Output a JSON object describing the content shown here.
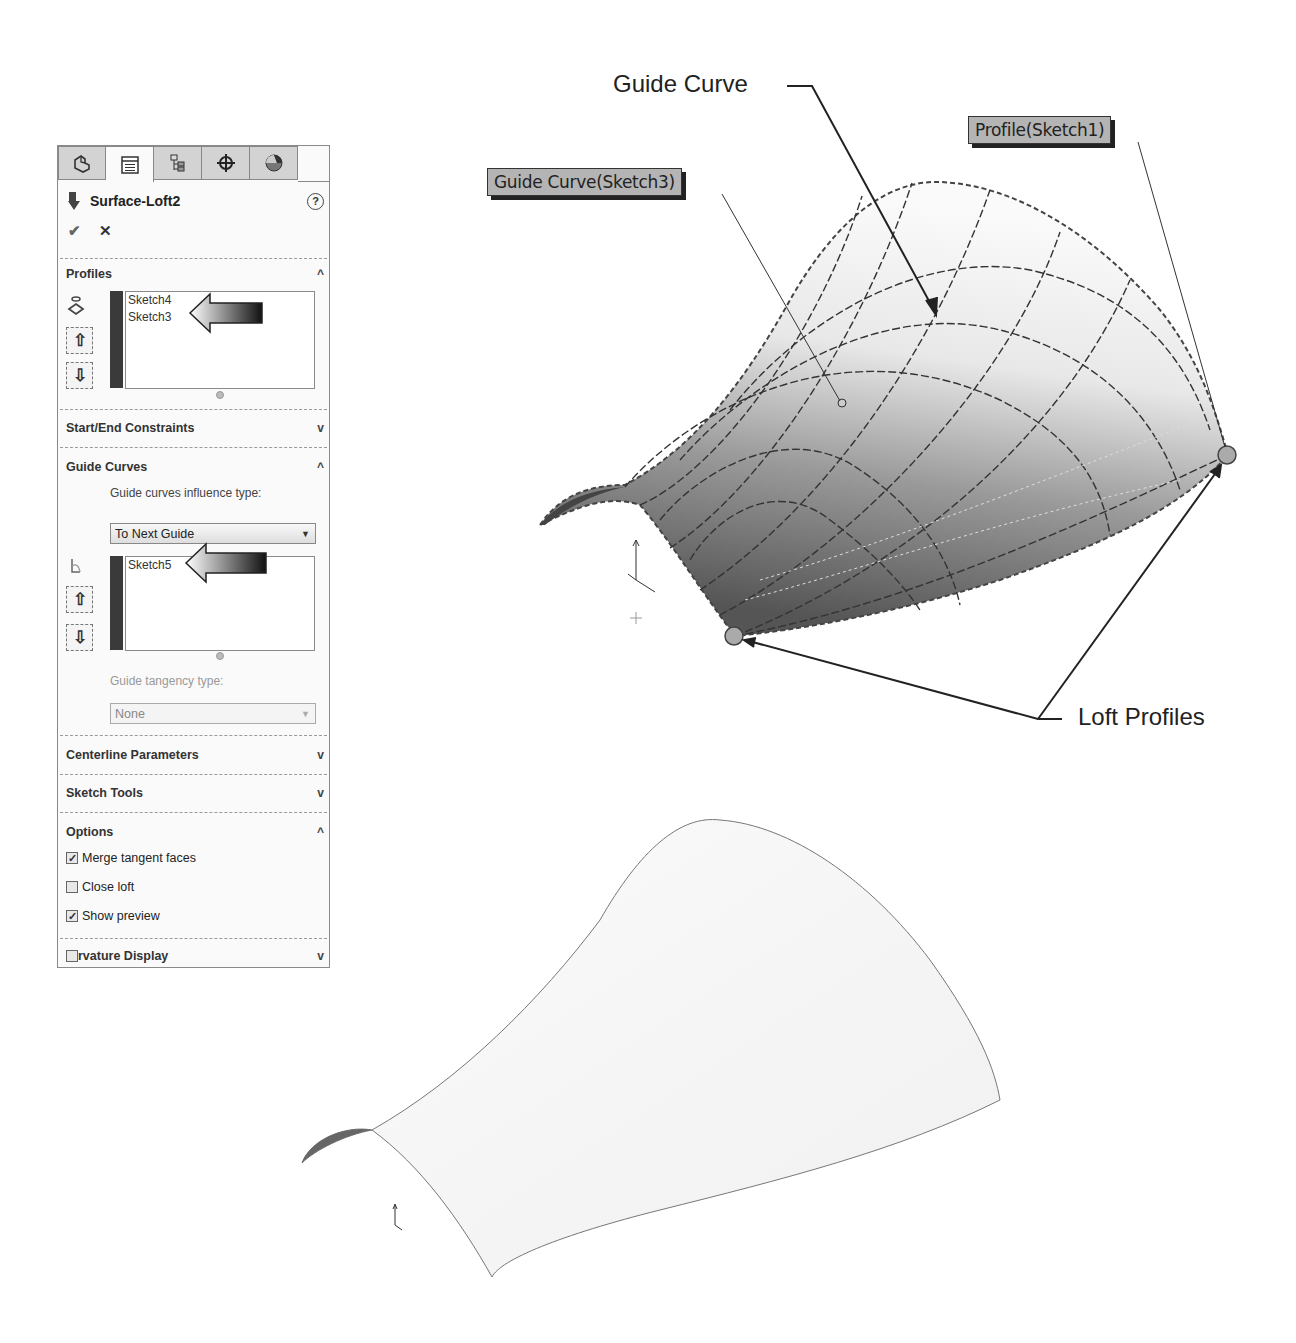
{
  "panel": {
    "tabs": [
      {
        "name": "feature-manager-tab",
        "icon": "part-icon"
      },
      {
        "name": "property-manager-tab",
        "icon": "property-list-icon",
        "active": true
      },
      {
        "name": "configuration-manager-tab",
        "icon": "configuration-icon"
      },
      {
        "name": "dimxpert-manager-tab",
        "icon": "crosshair-icon"
      },
      {
        "name": "display-manager-tab",
        "icon": "appearance-sphere-icon"
      }
    ],
    "title": "Surface-Loft2",
    "help_icon": "?",
    "ok_icon": "✔",
    "cancel_icon": "✕",
    "profiles": {
      "header": "Profiles",
      "chevron": "^",
      "items": [
        "Sketch4",
        "Sketch3"
      ]
    },
    "start_end_constraints": {
      "header": "Start/End Constraints",
      "chevron": "v"
    },
    "guide_curves": {
      "header": "Guide Curves",
      "chevron": "^",
      "influence_label": "Guide curves influence type:",
      "influence_value": "To Next Guide",
      "items": [
        "Sketch5"
      ],
      "tangency_label": "Guide tangency type:",
      "tangency_value": "None"
    },
    "centerline_parameters": {
      "header": "Centerline Parameters",
      "chevron": "v"
    },
    "sketch_tools": {
      "header": "Sketch Tools",
      "chevron": "v"
    },
    "options": {
      "header": "Options",
      "chevron": "^",
      "checkboxes": [
        {
          "label": "Merge tangent faces",
          "checked": true
        },
        {
          "label": "Close loft",
          "checked": false
        },
        {
          "label": "Show preview",
          "checked": true
        }
      ]
    },
    "curvature_display": {
      "header": "rvature Display",
      "chevron": "v",
      "checked": false
    }
  },
  "viewport": {
    "callouts": {
      "guide_curve": "Guide Curve",
      "loft_profiles": "Loft Profiles"
    },
    "tags": {
      "guide_curve_sketch3": "Guide Curve(Sketch3)",
      "profile_sketch1": "Profile(Sketch1)"
    }
  }
}
